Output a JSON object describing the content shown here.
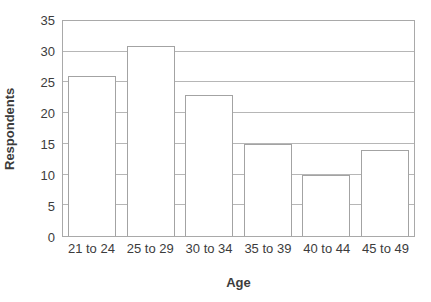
{
  "chart_data": {
    "type": "bar",
    "title": "",
    "categories": [
      "21 to 24",
      "25 to 29",
      "30 to 34",
      "35 to 39",
      "40 to 44",
      "45 to 49"
    ],
    "values": [
      26,
      31,
      23,
      15,
      10,
      14
    ],
    "xlabel": "Age",
    "ylabel": "Respondents",
    "ylim": [
      0,
      35
    ],
    "yticks": [
      0,
      5,
      10,
      15,
      20,
      25,
      30,
      35
    ],
    "grid": "horizontal",
    "legend_position": "none",
    "colors": {
      "bar_fill": "#ffffff",
      "bar_border": "#a3a3a3",
      "gridline": "#b6b6b6",
      "axis_frame": "#a9a9a9",
      "text": "#3c3c3c"
    }
  }
}
